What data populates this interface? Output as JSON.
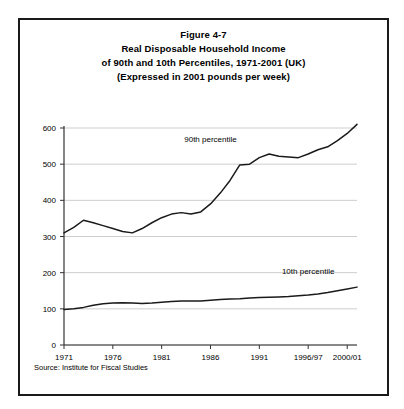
{
  "figure": {
    "title_lines": [
      "Figure 4-7",
      "Real Disposable Household Income",
      "of 90th and 10th Percentiles, 1971-2001 (UK)",
      "(Expressed in 2001 pounds per week)"
    ],
    "source": "Source: Institute for Fiscal Studies"
  },
  "chart_data": {
    "type": "line",
    "title": "Real Disposable Household Income of 90th and 10th Percentiles, 1971-2001 (UK)",
    "subtitle": "(Expressed in 2001 pounds per week)",
    "xlabel": "",
    "ylabel": "",
    "ylim": [
      0,
      600
    ],
    "yticks": [
      0,
      100,
      200,
      300,
      400,
      500,
      600
    ],
    "ytick_labels": [
      "0",
      "100",
      "200",
      "300",
      "400",
      "500",
      "600"
    ],
    "xtick_labels": [
      "1971",
      "1976",
      "1981",
      "1986",
      "1991",
      "1996/97",
      "2000/01"
    ],
    "xtick_years": [
      1971,
      1976,
      1981,
      1986,
      1991,
      1996,
      2000
    ],
    "xlim": [
      1971,
      2001
    ],
    "grid": true,
    "grid_axis": "y",
    "legend": "inline-annotations",
    "annotations": [
      {
        "text": "90th percentile",
        "year": 1986,
        "value": 560
      },
      {
        "text": "10th percentile",
        "year": 1996,
        "value": 195
      }
    ],
    "x": [
      1971,
      1972,
      1973,
      1974,
      1975,
      1976,
      1977,
      1978,
      1979,
      1980,
      1981,
      1982,
      1983,
      1984,
      1985,
      1986,
      1987,
      1988,
      1989,
      1990,
      1991,
      1992,
      1993,
      1994,
      1995,
      1996,
      1997,
      1998,
      1999,
      2000,
      2001
    ],
    "series": [
      {
        "name": "90th percentile",
        "values": [
          310,
          325,
          345,
          338,
          330,
          322,
          314,
          310,
          322,
          338,
          352,
          362,
          366,
          362,
          368,
          390,
          420,
          455,
          498,
          500,
          518,
          528,
          522,
          520,
          518,
          528,
          540,
          548,
          565,
          585,
          610
        ]
      },
      {
        "name": "10th percentile",
        "values": [
          98,
          100,
          104,
          110,
          114,
          116,
          117,
          116,
          115,
          116,
          118,
          120,
          122,
          122,
          122,
          124,
          126,
          127,
          128,
          130,
          131,
          132,
          133,
          134,
          136,
          138,
          141,
          145,
          150,
          155,
          160
        ]
      }
    ]
  }
}
